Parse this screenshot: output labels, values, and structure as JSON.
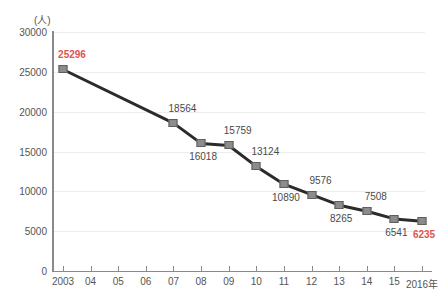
{
  "chart_data": {
    "type": "line",
    "title": "",
    "subtitle": "",
    "xlabel": "",
    "ylabel": "",
    "unit_label": "(人)",
    "x_axis_suffix": "年",
    "grid": true,
    "legend": "none",
    "ylim": [
      0,
      30000
    ],
    "ytick_step": 5000,
    "yticks": [
      "0",
      "5000",
      "10000",
      "15000",
      "20000",
      "25000",
      "30000"
    ],
    "ytick_values": [
      0,
      5000,
      10000,
      15000,
      20000,
      25000,
      30000
    ],
    "categories": [
      "2003",
      "04",
      "05",
      "06",
      "07",
      "08",
      "09",
      "10",
      "11",
      "12",
      "13",
      "14",
      "15",
      "2016年"
    ],
    "x_values": [
      2003,
      2004,
      2005,
      2006,
      2007,
      2008,
      2009,
      2010,
      2011,
      2012,
      2013,
      2014,
      2015,
      2016
    ],
    "values": [
      25296,
      null,
      null,
      null,
      18564,
      16018,
      15759,
      13124,
      10890,
      9576,
      8265,
      7508,
      6541,
      6235
    ],
    "points": [
      {
        "category": "2003",
        "value": 25296,
        "label": "25296",
        "label_position": "above",
        "highlight": true
      },
      {
        "category": "07",
        "value": 18564,
        "label": "18564",
        "label_position": "above",
        "highlight": false
      },
      {
        "category": "08",
        "value": 16018,
        "label": "16018",
        "label_position": "below",
        "highlight": false
      },
      {
        "category": "09",
        "value": 15759,
        "label": "15759",
        "label_position": "above",
        "highlight": false
      },
      {
        "category": "10",
        "value": 13124,
        "label": "13124",
        "label_position": "above",
        "highlight": false
      },
      {
        "category": "11",
        "value": 10890,
        "label": "10890",
        "label_position": "below",
        "highlight": false
      },
      {
        "category": "12",
        "value": 9576,
        "label": "9576",
        "label_position": "above",
        "highlight": false
      },
      {
        "category": "13",
        "value": 8265,
        "label": "8265",
        "label_position": "below",
        "highlight": false
      },
      {
        "category": "14",
        "value": 7508,
        "label": "7508",
        "label_position": "above",
        "highlight": false
      },
      {
        "category": "15",
        "value": 6541,
        "label": "6541",
        "label_position": "below",
        "highlight": false
      },
      {
        "category": "2016年",
        "value": 6235,
        "label": "6235",
        "label_position": "below",
        "highlight": true
      }
    ],
    "colors": {
      "line": "#2b2b2b",
      "marker_fill": "#8c8c8c",
      "marker_border": "#5e5e5e",
      "label": "#4a4a4a",
      "highlight_label": "#e0544e",
      "grid": "#ececec",
      "axis": "#8a8a8a",
      "background": "#ffffff"
    }
  }
}
